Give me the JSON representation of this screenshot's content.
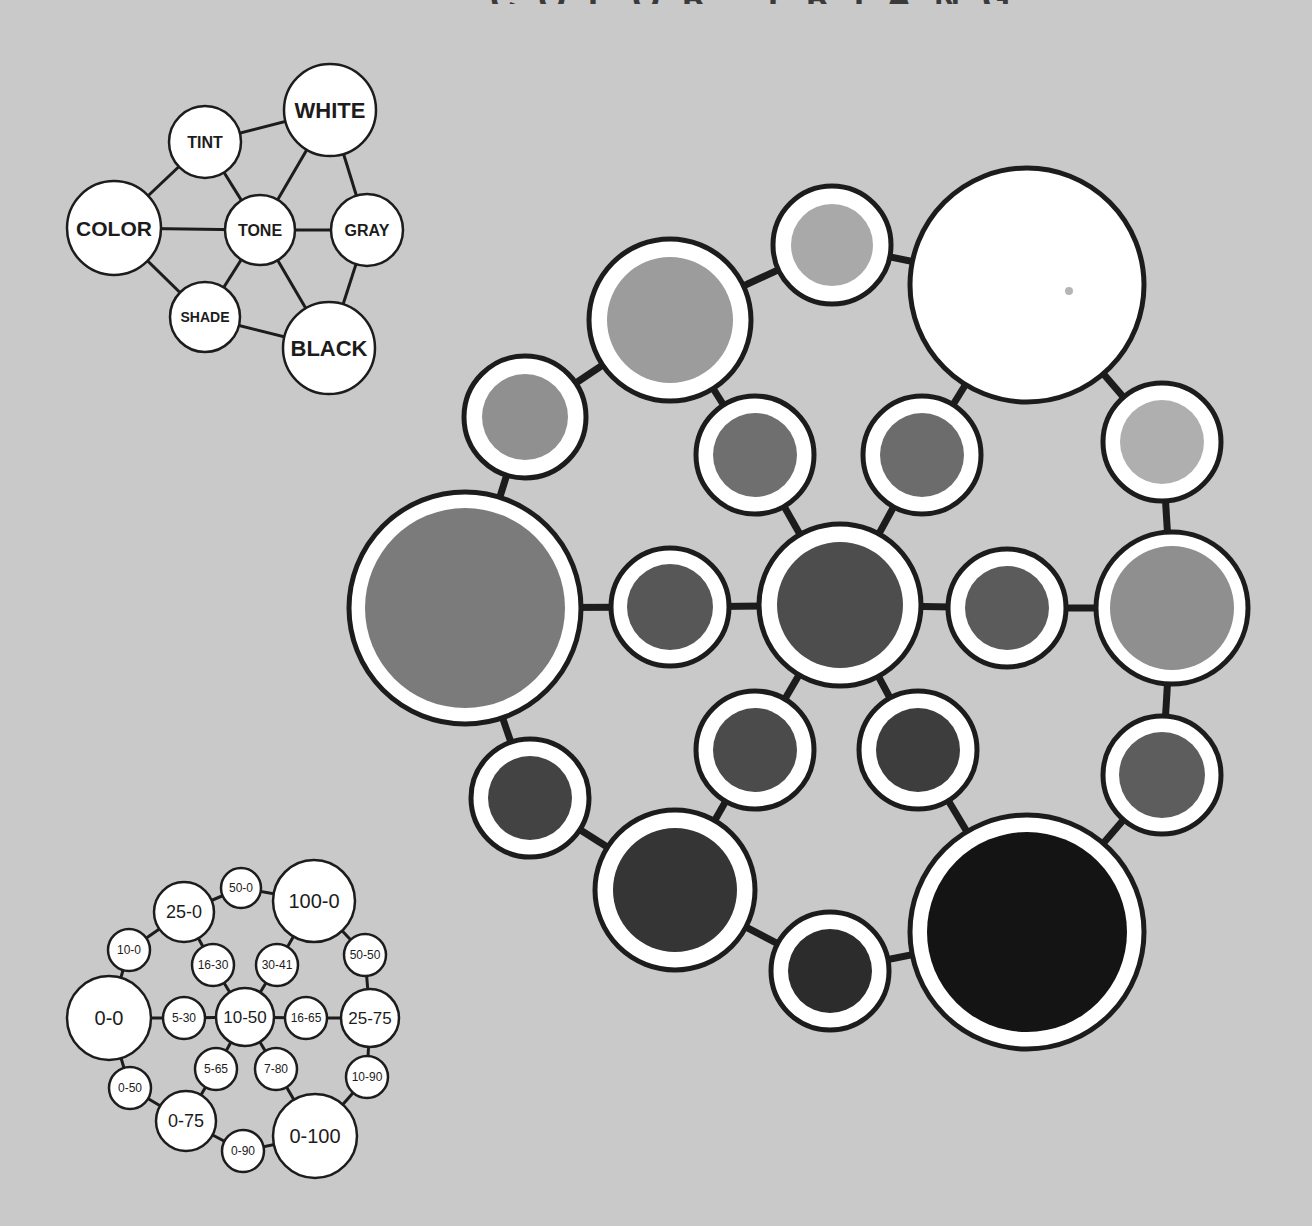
{
  "page": {
    "background": "#c9c9c9",
    "title_partial": "COLOR TRIANGLE"
  },
  "concept_diagram": {
    "nodes": [
      {
        "id": "white",
        "label": "WHITE",
        "cx": 330,
        "cy": 110,
        "r": 46,
        "fs": 22
      },
      {
        "id": "tint",
        "label": "TINT",
        "cx": 205,
        "cy": 142,
        "r": 36,
        "fs": 16
      },
      {
        "id": "color",
        "label": "COLOR",
        "cx": 114,
        "cy": 228,
        "r": 47,
        "fs": 21
      },
      {
        "id": "tone",
        "label": "TONE",
        "cx": 260,
        "cy": 230,
        "r": 35,
        "fs": 16
      },
      {
        "id": "gray",
        "label": "GRAY",
        "cx": 367,
        "cy": 230,
        "r": 36,
        "fs": 16
      },
      {
        "id": "shade",
        "label": "SHADE",
        "cx": 205,
        "cy": 317,
        "r": 35,
        "fs": 14
      },
      {
        "id": "black",
        "label": "BLACK",
        "cx": 329,
        "cy": 348,
        "r": 46,
        "fs": 22
      }
    ],
    "edges": [
      [
        "tint",
        "white"
      ],
      [
        "tint",
        "color"
      ],
      [
        "tint",
        "tone"
      ],
      [
        "white",
        "tone"
      ],
      [
        "white",
        "gray"
      ],
      [
        "color",
        "tone"
      ],
      [
        "tone",
        "gray"
      ],
      [
        "color",
        "shade"
      ],
      [
        "shade",
        "tone"
      ],
      [
        "tone",
        "black"
      ],
      [
        "gray",
        "black"
      ],
      [
        "shade",
        "black"
      ]
    ]
  },
  "key_diagram": {
    "nodes": [
      {
        "id": "k100-0",
        "label": "100-0",
        "cx": 314,
        "cy": 901,
        "r": 41,
        "fs": 20
      },
      {
        "id": "k50-0",
        "label": "50-0",
        "cx": 241,
        "cy": 888,
        "r": 20,
        "fs": 12
      },
      {
        "id": "k25-0",
        "label": "25-0",
        "cx": 184,
        "cy": 912,
        "r": 30,
        "fs": 18
      },
      {
        "id": "k10-0",
        "label": "10-0",
        "cx": 129,
        "cy": 950,
        "r": 21,
        "fs": 12
      },
      {
        "id": "k16-30",
        "label": "16-30",
        "cx": 213,
        "cy": 965,
        "r": 21,
        "fs": 12
      },
      {
        "id": "k30-41",
        "label": "30-41",
        "cx": 277,
        "cy": 965,
        "r": 21,
        "fs": 12
      },
      {
        "id": "k50-50",
        "label": "50-50",
        "cx": 365,
        "cy": 955,
        "r": 21,
        "fs": 12
      },
      {
        "id": "k0-0",
        "label": "0-0",
        "cx": 109,
        "cy": 1018,
        "r": 42,
        "fs": 20
      },
      {
        "id": "k5-30",
        "label": "5-30",
        "cx": 184,
        "cy": 1018,
        "r": 21,
        "fs": 12
      },
      {
        "id": "k10-50",
        "label": "10-50",
        "cx": 245,
        "cy": 1017,
        "r": 29,
        "fs": 17
      },
      {
        "id": "k16-65",
        "label": "16-65",
        "cx": 306,
        "cy": 1018,
        "r": 21,
        "fs": 12
      },
      {
        "id": "k25-75",
        "label": "25-75",
        "cx": 370,
        "cy": 1018,
        "r": 29,
        "fs": 17
      },
      {
        "id": "k5-65",
        "label": "5-65",
        "cx": 216,
        "cy": 1069,
        "r": 21,
        "fs": 12
      },
      {
        "id": "k7-80",
        "label": "7-80",
        "cx": 276,
        "cy": 1069,
        "r": 21,
        "fs": 12
      },
      {
        "id": "k10-90",
        "label": "10-90",
        "cx": 367,
        "cy": 1077,
        "r": 21,
        "fs": 12
      },
      {
        "id": "k0-50",
        "label": "0-50",
        "cx": 130,
        "cy": 1088,
        "r": 21,
        "fs": 12
      },
      {
        "id": "k0-75",
        "label": "0-75",
        "cx": 186,
        "cy": 1121,
        "r": 30,
        "fs": 18
      },
      {
        "id": "k0-90",
        "label": "0-90",
        "cx": 243,
        "cy": 1151,
        "r": 21,
        "fs": 12
      },
      {
        "id": "k0-100",
        "label": "0-100",
        "cx": 315,
        "cy": 1136,
        "r": 42,
        "fs": 20
      }
    ],
    "edges": [
      [
        "k0-0",
        "k10-0"
      ],
      [
        "k10-0",
        "k25-0"
      ],
      [
        "k25-0",
        "k50-0"
      ],
      [
        "k50-0",
        "k100-0"
      ],
      [
        "k100-0",
        "k50-50"
      ],
      [
        "k50-50",
        "k25-75"
      ],
      [
        "k25-75",
        "k10-90"
      ],
      [
        "k10-90",
        "k0-100"
      ],
      [
        "k0-100",
        "k0-90"
      ],
      [
        "k0-90",
        "k0-75"
      ],
      [
        "k0-75",
        "k0-50"
      ],
      [
        "k0-50",
        "k0-0"
      ],
      [
        "k0-0",
        "k5-30"
      ],
      [
        "k5-30",
        "k10-50"
      ],
      [
        "k10-50",
        "k16-65"
      ],
      [
        "k16-65",
        "k25-75"
      ],
      [
        "k25-0",
        "k16-30"
      ],
      [
        "k16-30",
        "k10-50"
      ],
      [
        "k100-0",
        "k30-41"
      ],
      [
        "k30-41",
        "k10-50"
      ],
      [
        "k10-50",
        "k5-65"
      ],
      [
        "k5-65",
        "k0-75"
      ],
      [
        "k10-50",
        "k7-80"
      ],
      [
        "k7-80",
        "k0-100"
      ]
    ]
  },
  "color_triangle": {
    "nodes": [
      {
        "id": "c0-0",
        "key": "0-0",
        "cx": 465,
        "cy": 608,
        "r": 116,
        "ir": 100,
        "fill": "#7b7b7b"
      },
      {
        "id": "c10-0",
        "key": "10-0",
        "cx": 525,
        "cy": 417,
        "r": 61,
        "ir": 43,
        "fill": "#909090"
      },
      {
        "id": "c25-0",
        "key": "25-0",
        "cx": 670,
        "cy": 320,
        "r": 81,
        "ir": 63,
        "fill": "#9c9c9c"
      },
      {
        "id": "c50-0",
        "key": "50-0",
        "cx": 832,
        "cy": 245,
        "r": 59,
        "ir": 41,
        "fill": "#a9a9a9"
      },
      {
        "id": "c100-0",
        "key": "100-0",
        "cx": 1027,
        "cy": 285,
        "r": 117,
        "ir": 0,
        "fill": "#ffffff"
      },
      {
        "id": "c50-50",
        "key": "50-50",
        "cx": 1162,
        "cy": 442,
        "r": 59,
        "ir": 42,
        "fill": "#afafaf"
      },
      {
        "id": "c25-75",
        "key": "25-75",
        "cx": 1172,
        "cy": 608,
        "r": 76,
        "ir": 62,
        "fill": "#8f8f8f"
      },
      {
        "id": "c10-90",
        "key": "10-90",
        "cx": 1162,
        "cy": 775,
        "r": 59,
        "ir": 43,
        "fill": "#5d5d5d"
      },
      {
        "id": "c0-100",
        "key": "0-100",
        "cx": 1027,
        "cy": 932,
        "r": 117,
        "ir": 100,
        "fill": "#141414"
      },
      {
        "id": "c0-90",
        "key": "0-90",
        "cx": 830,
        "cy": 971,
        "r": 59,
        "ir": 42,
        "fill": "#2c2c2c"
      },
      {
        "id": "c0-75",
        "key": "0-75",
        "cx": 675,
        "cy": 890,
        "r": 80,
        "ir": 62,
        "fill": "#353535"
      },
      {
        "id": "c0-50",
        "key": "0-50",
        "cx": 530,
        "cy": 798,
        "r": 59,
        "ir": 42,
        "fill": "#434343"
      },
      {
        "id": "c5-30",
        "key": "5-30",
        "cx": 670,
        "cy": 607,
        "r": 59,
        "ir": 43,
        "fill": "#575757"
      },
      {
        "id": "c10-50",
        "key": "10-50",
        "cx": 840,
        "cy": 605,
        "r": 81,
        "ir": 63,
        "fill": "#4d4d4d"
      },
      {
        "id": "c16-65",
        "key": "16-65",
        "cx": 1007,
        "cy": 608,
        "r": 59,
        "ir": 42,
        "fill": "#5b5b5b"
      },
      {
        "id": "c16-30",
        "key": "16-30",
        "cx": 755,
        "cy": 455,
        "r": 59,
        "ir": 42,
        "fill": "#6f6f6f"
      },
      {
        "id": "c30-41",
        "key": "30-41",
        "cx": 922,
        "cy": 455,
        "r": 59,
        "ir": 42,
        "fill": "#6c6c6c"
      },
      {
        "id": "c5-65",
        "key": "5-65",
        "cx": 755,
        "cy": 750,
        "r": 59,
        "ir": 42,
        "fill": "#4b4b4b"
      },
      {
        "id": "c7-80",
        "key": "7-80",
        "cx": 918,
        "cy": 750,
        "r": 59,
        "ir": 42,
        "fill": "#3d3d3d"
      }
    ],
    "edges": [
      [
        "c0-0",
        "c10-0"
      ],
      [
        "c10-0",
        "c25-0"
      ],
      [
        "c25-0",
        "c50-0"
      ],
      [
        "c50-0",
        "c100-0"
      ],
      [
        "c100-0",
        "c50-50"
      ],
      [
        "c50-50",
        "c25-75"
      ],
      [
        "c25-75",
        "c10-90"
      ],
      [
        "c10-90",
        "c0-100"
      ],
      [
        "c0-100",
        "c0-90"
      ],
      [
        "c0-90",
        "c0-75"
      ],
      [
        "c0-75",
        "c0-50"
      ],
      [
        "c0-50",
        "c0-0"
      ],
      [
        "c0-0",
        "c5-30"
      ],
      [
        "c5-30",
        "c10-50"
      ],
      [
        "c10-50",
        "c16-65"
      ],
      [
        "c16-65",
        "c25-75"
      ],
      [
        "c25-0",
        "c16-30"
      ],
      [
        "c16-30",
        "c10-50"
      ],
      [
        "c100-0",
        "c30-41"
      ],
      [
        "c30-41",
        "c10-50"
      ],
      [
        "c10-50",
        "c5-65"
      ],
      [
        "c5-65",
        "c0-75"
      ],
      [
        "c10-50",
        "c7-80"
      ],
      [
        "c7-80",
        "c0-100"
      ]
    ],
    "white_dot": {
      "cx": 1069,
      "cy": 291,
      "r": 4,
      "fill": "#b5b5b5"
    }
  }
}
